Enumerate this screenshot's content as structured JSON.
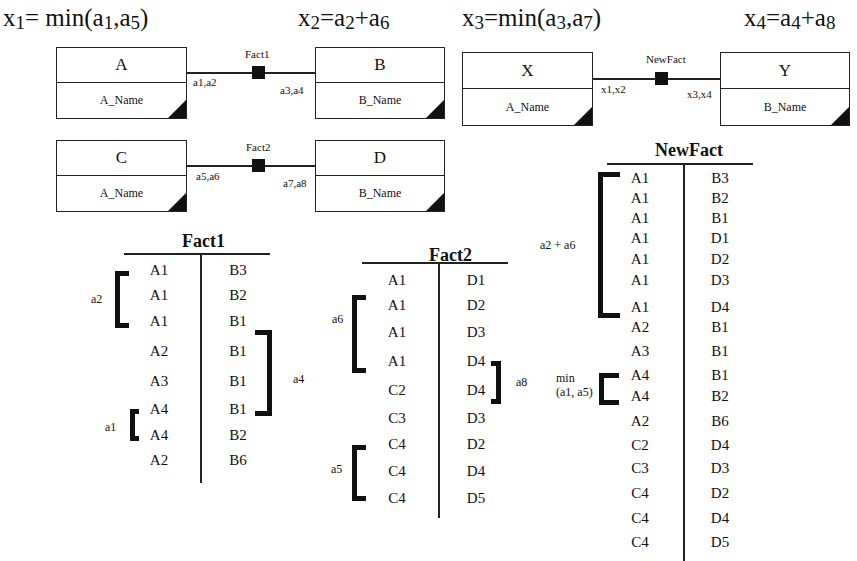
{
  "formulas": {
    "x1": {
      "lhs": "x",
      "lhs_sub": "1",
      "rhs_pre": "= min(a",
      "s1": "1",
      "mid": ",a",
      "s2": "5",
      "post": ")"
    },
    "x2": {
      "lhs": "x",
      "lhs_sub": "2",
      "rhs_pre": "=a",
      "s1": "2",
      "mid": "+a",
      "s2": "6",
      "post": ""
    },
    "x3": {
      "lhs": "x",
      "lhs_sub": "3",
      "rhs_pre": "=min(a",
      "s1": "3",
      "mid": ",a",
      "s2": "7",
      "post": ")"
    },
    "x4": {
      "lhs": "x",
      "lhs_sub": "4",
      "rhs_pre": "=a",
      "s1": "4",
      "mid": "+a",
      "s2": "8",
      "post": ""
    }
  },
  "schemas": [
    {
      "fact": "Fact1",
      "left": {
        "name": "A",
        "attr": "A_Name"
      },
      "left_role": "a1,a2",
      "right": {
        "name": "B",
        "attr": "B_Name"
      },
      "right_role": "a3,a4"
    },
    {
      "fact": "Fact2",
      "left": {
        "name": "C",
        "attr": "A_Name"
      },
      "left_role": "a5,a6",
      "right": {
        "name": "D",
        "attr": "B_Name"
      },
      "right_role": "a7,a8"
    },
    {
      "fact": "NewFact",
      "left": {
        "name": "X",
        "attr": "A_Name"
      },
      "left_role": "x1,x2",
      "right": {
        "name": "Y",
        "attr": "B_Name"
      },
      "right_role": "x3,x4"
    }
  ],
  "tables": {
    "fact1": {
      "title": "Fact1",
      "rows": [
        [
          "A1",
          "B3"
        ],
        [
          "A1",
          "B2"
        ],
        [
          "A1",
          "B1"
        ],
        [
          "A2",
          "B1"
        ],
        [
          "A3",
          "B1"
        ],
        [
          "A4",
          "B1"
        ],
        [
          "A4",
          "B2"
        ],
        [
          "A2",
          "B6"
        ]
      ],
      "brackets": [
        {
          "label": "a2",
          "side": "left",
          "rows": "0-2"
        },
        {
          "label": "a4",
          "side": "right",
          "rows": "2-5"
        },
        {
          "label": "a1",
          "side": "left",
          "rows": "5-6"
        }
      ]
    },
    "fact2": {
      "title": "Fact2",
      "rows": [
        [
          "A1",
          "D1"
        ],
        [
          "A1",
          "D2"
        ],
        [
          "A1",
          "D3"
        ],
        [
          "A1",
          "D4"
        ],
        [
          "C2",
          "D4"
        ],
        [
          "C3",
          "D3"
        ],
        [
          "C4",
          "D2"
        ],
        [
          "C4",
          "D4"
        ],
        [
          "C4",
          "D5"
        ]
      ],
      "brackets": [
        {
          "label": "a6",
          "side": "left",
          "rows": "1-3"
        },
        {
          "label": "a8",
          "side": "right",
          "rows": "3-4"
        },
        {
          "label": "a5",
          "side": "left",
          "rows": "6-8"
        }
      ]
    },
    "newfact": {
      "title": "NewFact",
      "rows": [
        [
          "A1",
          "B3"
        ],
        [
          "A1",
          "B2"
        ],
        [
          "A1",
          "B1"
        ],
        [
          "A1",
          "D1"
        ],
        [
          "A1",
          "D2"
        ],
        [
          "A1",
          "D3"
        ],
        [
          "A1",
          "D4"
        ],
        [
          "A2",
          "B1"
        ],
        [
          "A3",
          "B1"
        ],
        [
          "A4",
          "B1"
        ],
        [
          "A4",
          "B2"
        ],
        [
          "A2",
          "B6"
        ],
        [
          "C2",
          "D4"
        ],
        [
          "C3",
          "D3"
        ],
        [
          "C4",
          "D2"
        ],
        [
          "C4",
          "D4"
        ],
        [
          "C4",
          "D5"
        ]
      ],
      "brackets": [
        {
          "label": "a2 + a6",
          "side": "left",
          "rows": "0-6"
        },
        {
          "label": "min\n(a1, a5)",
          "label_line1": "min",
          "label_line2": "(a1, a5)",
          "side": "left",
          "rows": "9-10"
        }
      ]
    }
  }
}
